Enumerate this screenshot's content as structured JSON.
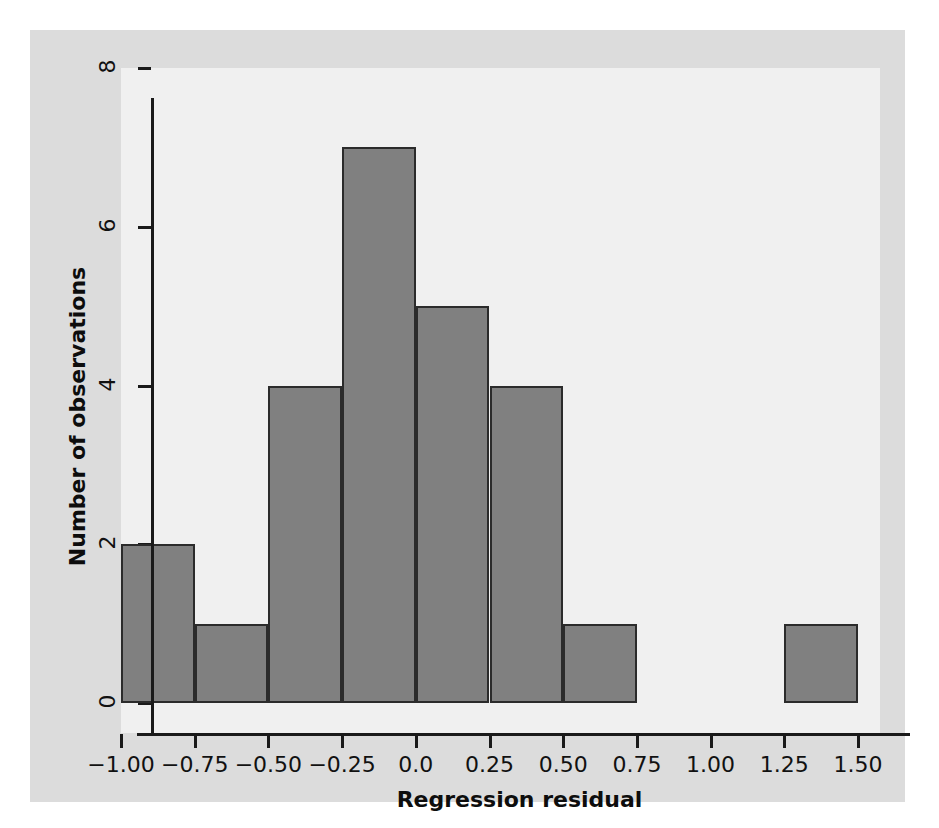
{
  "chart_data": {
    "type": "bar",
    "chart_subtype": "histogram",
    "title": "",
    "xlabel": "Regression residual",
    "ylabel": "Number of observations",
    "xlim": [
      -1.0,
      1.5
    ],
    "ylim": [
      0,
      8
    ],
    "bin_width": 0.25,
    "grid": false,
    "legend": null,
    "categories": [
      "-1.00 to -0.75",
      "-0.75 to -0.50",
      "-0.50 to -0.25",
      "-0.25 to 0.00",
      "0.00 to 0.25",
      "0.25 to 0.50",
      "0.50 to 0.75",
      "0.75 to 1.00",
      "1.00 to 1.25",
      "1.25 to 1.50"
    ],
    "bin_edges": [
      -1.0,
      -0.75,
      -0.5,
      -0.25,
      0.0,
      0.25,
      0.5,
      0.75,
      1.0,
      1.25,
      1.5
    ],
    "values": [
      2,
      1,
      4,
      7,
      5,
      4,
      1,
      0,
      0,
      1
    ],
    "total_observations": 25,
    "xticks": [
      -1.0,
      -0.75,
      -0.5,
      -0.25,
      0.0,
      0.25,
      0.5,
      0.75,
      1.0,
      1.25,
      1.5
    ],
    "xticklabels": [
      "−1.00",
      "−0.75",
      "−0.50",
      "−0.25",
      "0.0",
      "0.25",
      "0.50",
      "0.75",
      "1.00",
      "1.25",
      "1.50"
    ],
    "yticks": [
      0,
      2,
      4,
      6,
      8
    ],
    "yticklabels": [
      "0",
      "2",
      "4",
      "6",
      "8"
    ],
    "colors": {
      "bar_fill": "#808080",
      "bar_edge": "#2b2b2b",
      "plot_background": "#f0f0f0",
      "figure_background": "#dcdcdc",
      "page_background": "#ffffff",
      "axis_line": "#1a1a1a",
      "text": "#111111"
    }
  }
}
